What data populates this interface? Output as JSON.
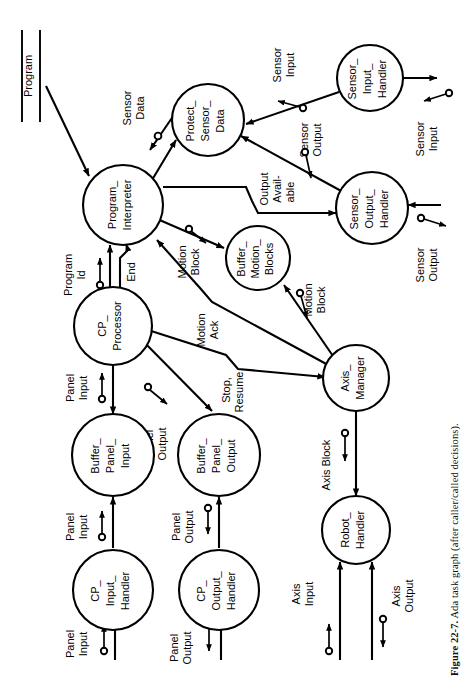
{
  "figure": {
    "caption_label": "Figure 22-7.",
    "caption_text": "Ada task graph (after caller/called decisions).",
    "orientation": "rotated-90-ccw",
    "accent_color": "#000000",
    "background_color": "#ffffff"
  },
  "stores": [
    {
      "id": "program-store",
      "label": "Program"
    }
  ],
  "nodes": [
    {
      "id": "program-interpreter",
      "label": "Program_\nInterpreter",
      "lines": [
        "Program_",
        "Interpreter"
      ]
    },
    {
      "id": "protect-sensor-data",
      "label": "Protect_\nSensor_\nData",
      "lines": [
        "Protect_",
        "Sensor_",
        "Data"
      ]
    },
    {
      "id": "sensor-input-handler",
      "label": "Sensor_\nInput_\nHandler",
      "lines": [
        "Sensor_",
        "Input_",
        "Handler"
      ]
    },
    {
      "id": "sensor-output-handler",
      "label": "Sensor_\nOutput_\nHandler",
      "lines": [
        "Sensor_",
        "Output_",
        "Handler"
      ]
    },
    {
      "id": "buffer-motion-blocks",
      "label": "Buffer_\nMotion_\nBlocks",
      "lines": [
        "Buffer_",
        "Motion_",
        "Blocks"
      ]
    },
    {
      "id": "cp-processor",
      "label": "CP_\nProcessor",
      "lines": [
        "CP_",
        "Processor"
      ]
    },
    {
      "id": "axis-manager",
      "label": "Axis_\nManager",
      "lines": [
        "Axis_",
        "Manager"
      ]
    },
    {
      "id": "robot-handler",
      "label": "Robot_\nHandler",
      "lines": [
        "Robot_",
        "Handler"
      ]
    },
    {
      "id": "buffer-panel-input",
      "label": "Buffer_\nPanel_\nInput",
      "lines": [
        "Buffer_",
        "Panel_",
        "Input"
      ]
    },
    {
      "id": "buffer-panel-output",
      "label": "Buffer_\nPanel_\nOutput",
      "lines": [
        "Buffer_",
        "Panel_",
        "Output"
      ]
    },
    {
      "id": "cp-input-handler",
      "label": "CP_\nInput_\nHandler",
      "lines": [
        "CP_",
        "Input_",
        "Handler"
      ]
    },
    {
      "id": "cp-output-handler",
      "label": "CP_\nOutput_\nHandler",
      "lines": [
        "CP_",
        "Output_",
        "Handler"
      ]
    }
  ],
  "flows": [
    {
      "id": "flow-program",
      "lines": [
        "Program"
      ]
    },
    {
      "id": "flow-sensor-data",
      "lines": [
        "Sensor",
        "Data"
      ]
    },
    {
      "id": "flow-sensor-input-top",
      "lines": [
        "Sensor",
        "Input"
      ]
    },
    {
      "id": "flow-sensor-output-mid",
      "lines": [
        "Sensor",
        "Output"
      ]
    },
    {
      "id": "flow-sensor-input-ext",
      "lines": [
        "Sensor",
        "Input"
      ]
    },
    {
      "id": "flow-sensor-output-ext",
      "lines": [
        "Sensor",
        "Output"
      ]
    },
    {
      "id": "flow-output-available",
      "lines": [
        "Output",
        "Avail-",
        "able"
      ]
    },
    {
      "id": "flow-motion-block-pi",
      "lines": [
        "Motion",
        "Block"
      ]
    },
    {
      "id": "flow-motion-block-am",
      "lines": [
        "Motion",
        "Block"
      ]
    },
    {
      "id": "flow-motion-ack",
      "lines": [
        "Motion",
        "Ack"
      ]
    },
    {
      "id": "flow-stop-resume",
      "lines": [
        "Stop,",
        "Resume"
      ]
    },
    {
      "id": "flow-program-id",
      "lines": [
        "Program",
        "Id"
      ]
    },
    {
      "id": "flow-end",
      "lines": [
        "End"
      ]
    },
    {
      "id": "flow-panel-input-cpp",
      "lines": [
        "Panel",
        "Input"
      ]
    },
    {
      "id": "flow-panel-output-cpp",
      "lines": [
        "Panel",
        "Output"
      ]
    },
    {
      "id": "flow-panel-input-cpih",
      "lines": [
        "Panel",
        "Input"
      ]
    },
    {
      "id": "flow-panel-output-cpoh",
      "lines": [
        "Panel",
        "Output"
      ]
    },
    {
      "id": "flow-panel-input-ext",
      "lines": [
        "Panel",
        "Input"
      ]
    },
    {
      "id": "flow-panel-output-ext",
      "lines": [
        "Panel",
        "Output"
      ]
    },
    {
      "id": "flow-axis-block",
      "lines": [
        "Axis Block"
      ]
    },
    {
      "id": "flow-axis-input",
      "lines": [
        "Axis",
        "Input"
      ]
    },
    {
      "id": "flow-axis-output",
      "lines": [
        "Axis",
        "Output"
      ]
    }
  ]
}
